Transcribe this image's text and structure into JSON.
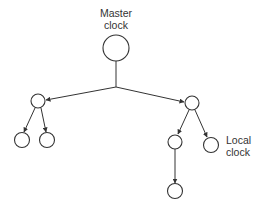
{
  "diagram": {
    "type": "clock-distribution-tree",
    "labels": {
      "master": [
        "Master",
        "clock"
      ],
      "local": [
        "Local",
        "clock"
      ]
    },
    "nodes": [
      {
        "id": "master",
        "role": "master-clock"
      },
      {
        "id": "left",
        "role": "intermediate"
      },
      {
        "id": "left-a",
        "role": "leaf"
      },
      {
        "id": "left-b",
        "role": "leaf"
      },
      {
        "id": "right",
        "role": "intermediate"
      },
      {
        "id": "right-a",
        "role": "intermediate"
      },
      {
        "id": "right-b",
        "role": "local-clock"
      },
      {
        "id": "right-a-child",
        "role": "leaf"
      }
    ],
    "edges": [
      {
        "from": "master",
        "to": "left"
      },
      {
        "from": "master",
        "to": "right"
      },
      {
        "from": "left",
        "to": "left-a"
      },
      {
        "from": "left",
        "to": "left-b"
      },
      {
        "from": "right",
        "to": "right-a"
      },
      {
        "from": "right",
        "to": "right-b"
      },
      {
        "from": "right-a",
        "to": "right-a-child"
      }
    ],
    "colors": {
      "line": "#333333",
      "background": "#ffffff"
    }
  }
}
